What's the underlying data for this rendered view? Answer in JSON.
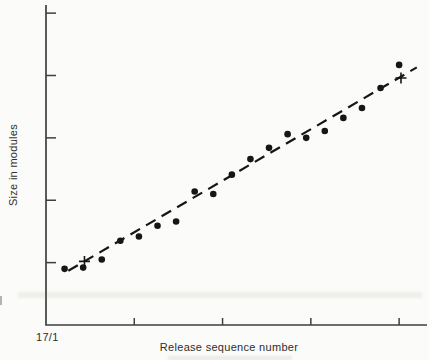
{
  "figure": {
    "background_color": "#fbfbf9",
    "ink_color": "#161616",
    "axis_color": "#3f3f3f",
    "text_color": "#2e2e2e"
  },
  "chart_data": {
    "type": "scatter",
    "title": "",
    "xlabel": "Release sequence number",
    "ylabel": "Size in modules",
    "origin_label": "17/1",
    "xlim": [
      0,
      20.5
    ],
    "ylim": [
      0,
      5.05
    ],
    "x_ticks": [
      4.75,
      9.5,
      14.25,
      19
    ],
    "y_ticks": [
      1,
      2,
      3,
      4,
      5
    ],
    "tick_numeric_labels_shown": false,
    "grid": false,
    "legend": null,
    "note": "Axes carry no numeric tick labels in the source figure; sizes are in arbitrary module units read off evenly spaced ticks, x is release sequence number.",
    "series": [
      {
        "name": "observed-release-size",
        "marker": "dot",
        "marker_radius": 3.3,
        "points": [
          [
            1,
            0.9
          ],
          [
            2,
            0.92
          ],
          [
            3,
            1.05
          ],
          [
            4,
            1.35
          ],
          [
            5,
            1.42
          ],
          [
            6,
            1.59
          ],
          [
            7,
            1.66
          ],
          [
            8,
            2.14
          ],
          [
            9,
            2.1
          ],
          [
            10,
            2.41
          ],
          [
            11,
            2.66
          ],
          [
            12,
            2.84
          ],
          [
            13,
            3.06
          ],
          [
            14,
            3.0
          ],
          [
            15,
            3.11
          ],
          [
            16,
            3.32
          ],
          [
            17,
            3.48
          ],
          [
            18,
            3.8
          ],
          [
            19,
            4.17
          ]
        ]
      },
      {
        "name": "trend-reference-points",
        "marker": "plus",
        "marker_size": 11,
        "points": [
          [
            2.07,
            1.02
          ],
          [
            19.1,
            3.96
          ]
        ]
      }
    ],
    "trendline": {
      "style": "dashed",
      "dash": "11 7",
      "from": [
        1.2,
        0.87
      ],
      "to": [
        19.95,
        4.13
      ]
    }
  }
}
